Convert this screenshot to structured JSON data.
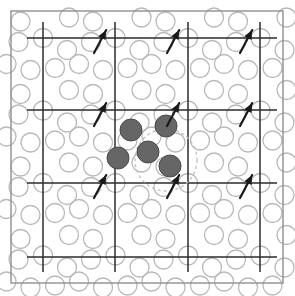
{
  "figure": {
    "width": 295,
    "height": 296,
    "background_color": "#ffffff",
    "frame": {
      "name": "outer-frame",
      "x": 11,
      "y": 11,
      "width": 272,
      "height": 272,
      "stroke_color": "#8f8f8f",
      "stroke_width": 1.4
    },
    "grid": {
      "name": "lattice-grid",
      "stroke_color": "#2b2b2b",
      "stroke_width": 1.5,
      "vertical_x": [
        43,
        115,
        188,
        260
      ],
      "vertical_y_start": 22,
      "vertical_y_end": 272,
      "horizontal_y": [
        38,
        110,
        183,
        257
      ],
      "horizontal_x_start": 27,
      "horizontal_x_end": 277
    },
    "background_circles": {
      "name": "lattice-atom-outline",
      "radius": 9.5,
      "stroke_color": "#b9b9b9",
      "stroke_width": 1.3,
      "fill": "none",
      "cell_width": 72.5,
      "cell_height": 72.5,
      "origin_x": 43,
      "origin_y": 38,
      "unit_offsets": [
        {
          "dx": 0.0,
          "dy": 0.0
        },
        {
          "dx": 24.0,
          "dy": 12.0
        },
        {
          "dx": 48.0,
          "dy": 4.0
        },
        {
          "dx": 12.0,
          "dy": 30.0
        },
        {
          "dx": 36.0,
          "dy": 26.0
        },
        {
          "dx": 60.0,
          "dy": 32.0
        },
        {
          "dx": 26.0,
          "dy": 52.0
        },
        {
          "dx": 50.0,
          "dy": 56.0
        }
      ]
    },
    "filled_atoms": {
      "name": "defect-atom",
      "fill_color": "#666666",
      "stroke_color": "#4a4a4a",
      "stroke_width": 1.0,
      "radius": 11,
      "points": [
        {
          "cx": 131,
          "cy": 130,
          "label": "defect-atom-upper-left"
        },
        {
          "cx": 166,
          "cy": 126,
          "label": "defect-atom-upper-right"
        },
        {
          "cx": 148,
          "cy": 152,
          "label": "defect-atom-center"
        },
        {
          "cx": 118,
          "cy": 158,
          "label": "defect-atom-left"
        },
        {
          "cx": 170,
          "cy": 166,
          "label": "defect-atom-lower-right"
        }
      ]
    },
    "dashed_region": {
      "name": "defect-boundary",
      "cx": 166,
      "cy": 160,
      "r": 31,
      "stroke_color": "#bdbdbd",
      "stroke_width": 1.3,
      "dash_pattern": "3,3"
    },
    "arrows": {
      "name": "displacement-arrow",
      "stroke_color": "#1a1a1a",
      "stroke_width": 2.2,
      "length": 26,
      "angle_deg": -62,
      "head_size": 5,
      "anchors": [
        {
          "x": 94,
          "y": 53,
          "label": "arrow-row1-col1"
        },
        {
          "x": 167,
          "y": 53,
          "label": "arrow-row1-col2"
        },
        {
          "x": 240,
          "y": 53,
          "label": "arrow-row1-col3"
        },
        {
          "x": 94,
          "y": 126,
          "label": "arrow-row2-col1"
        },
        {
          "x": 167,
          "y": 126,
          "label": "arrow-row2-col2"
        },
        {
          "x": 240,
          "y": 126,
          "label": "arrow-row2-col3"
        },
        {
          "x": 94,
          "y": 198,
          "label": "arrow-row3-col1"
        },
        {
          "x": 167,
          "y": 198,
          "label": "arrow-row3-col2"
        },
        {
          "x": 240,
          "y": 198,
          "label": "arrow-row3-col3"
        }
      ]
    }
  }
}
